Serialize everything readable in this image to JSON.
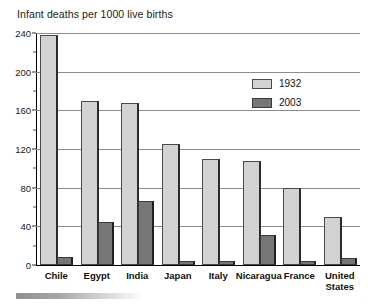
{
  "chart_data": {
    "type": "bar",
    "title": "Infant deaths per 1000 live births",
    "xlabel": "",
    "ylabel": "",
    "ylim": [
      0,
      240
    ],
    "yticks": [
      0,
      40,
      80,
      120,
      160,
      200,
      240
    ],
    "ytick_labels": [
      "0",
      "40",
      "80",
      "120",
      "160",
      "200",
      "240"
    ],
    "grid": true,
    "legend_position": "upper right",
    "categories": [
      "Chile",
      "Egypt",
      "India",
      "Japan",
      "Italy",
      "Nicaragua",
      "France",
      "United\nStates"
    ],
    "series": [
      {
        "name": "1932",
        "color": "#d2d2d2",
        "values": [
          238,
          170,
          168,
          125,
          110,
          108,
          80,
          50
        ]
      },
      {
        "name": "2003",
        "color": "#767676",
        "values": [
          8,
          45,
          66,
          3,
          4,
          31,
          4,
          7
        ]
      }
    ]
  },
  "legend": {
    "items": [
      {
        "label": "1932",
        "swatch": "light-gray"
      },
      {
        "label": "2003",
        "swatch": "dark-gray"
      }
    ]
  },
  "colors": {
    "series_1932": "#d2d2d2",
    "series_2003": "#767676",
    "gridline": "#8c8c8c",
    "axis": "#000000",
    "text": "#111111",
    "background": "#ffffff"
  }
}
